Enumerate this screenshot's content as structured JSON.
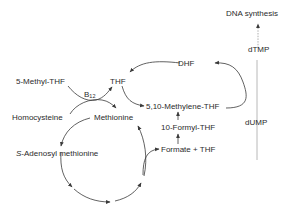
{
  "diagram": {
    "nodes": {
      "dna_synthesis": "DNA synthesis",
      "dtmp": "dTMP",
      "dhf": "DHF",
      "thf": "THF",
      "methyl_thf": "5-Methyl-THF",
      "b12_base": "B",
      "b12_sub": "12",
      "homocysteine": "Homocysteine",
      "methionine": "Methionine",
      "methylene_thf": "5,10-Methylene-THF",
      "formyl_thf": "10-Formyl-THF",
      "formate_thf": "Formate + THF",
      "dump": "dUMP",
      "sam_prefix": "S",
      "sam_rest": "-Adenosyl methionine"
    },
    "edges": [
      {
        "from": "dTMP",
        "to": "DNA synthesis",
        "style": "dashed"
      },
      {
        "from": "dUMP",
        "to": "dTMP",
        "style": "solid"
      },
      {
        "from": "5,10-Methylene-THF",
        "to": "DHF",
        "style": "solid"
      },
      {
        "from": "DHF",
        "to": "THF",
        "style": "solid"
      },
      {
        "from": "THF",
        "to": "5,10-Methylene-THF",
        "style": "solid"
      },
      {
        "from": "5-Methyl-THF",
        "to": "THF",
        "style": "solid",
        "cofactor": "B12"
      },
      {
        "from": "Homocysteine",
        "to": "Methionine",
        "style": "solid"
      },
      {
        "from": "Methionine",
        "to": "S-Adenosyl methionine",
        "style": "solid"
      },
      {
        "from": "S-Adenosyl methionine",
        "to": "Methionine",
        "style": "cycle"
      },
      {
        "from": "cycle",
        "to": "Formate + THF",
        "style": "solid"
      },
      {
        "from": "Formate + THF",
        "to": "10-Formyl-THF",
        "style": "solid"
      },
      {
        "from": "10-Formyl-THF",
        "to": "5,10-Methylene-THF",
        "style": "solid"
      }
    ],
    "colors": {
      "text": "#2b2b2b",
      "line": "#3a3a3a",
      "dashed": "#9a9a9a",
      "background": "#ffffff"
    }
  }
}
